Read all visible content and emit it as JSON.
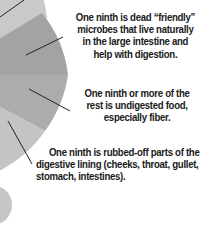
{
  "diagram": {
    "type": "pie-annotation",
    "segments": [
      {
        "name": "top-segment",
        "color": "#c9c9c9"
      },
      {
        "name": "friendly-microbes-segment",
        "color": "#a3a3a3"
      },
      {
        "name": "undigested-food-segment",
        "color": "#acacac"
      },
      {
        "name": "digestive-lining-segment",
        "color": "#c4c4c4"
      }
    ],
    "annotations": [
      {
        "lines": [
          "One ninth is dead “friendly”",
          "microbes that live naturally",
          "in the large intestine and",
          "help with digestion."
        ]
      },
      {
        "lines": [
          "One ninth or more of the",
          "rest is undigested food,",
          "especially fiber."
        ]
      },
      {
        "lines": [
          "One ninth is rubbed-off parts of the",
          "digestive lining (cheeks, throat, gullet,",
          "stomach, intestines)."
        ]
      }
    ],
    "bottom_circle_color": "#c6c6c6"
  }
}
